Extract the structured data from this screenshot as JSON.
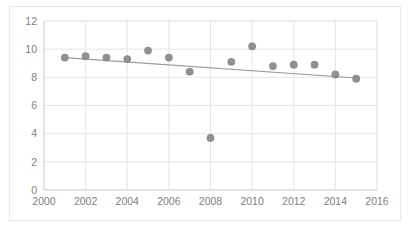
{
  "chart_data": {
    "type": "scatter",
    "title": "",
    "subtitle": "",
    "xlabel": "",
    "ylabel": "",
    "xlim": [
      2000,
      2016
    ],
    "ylim": [
      0,
      12
    ],
    "xticks": [
      2000,
      2002,
      2004,
      2006,
      2008,
      2010,
      2012,
      2014,
      2016
    ],
    "yticks": [
      0,
      2,
      4,
      6,
      8,
      10,
      12
    ],
    "grid": true,
    "legend": "none",
    "x": [
      2001,
      2002,
      2003,
      2004,
      2005,
      2006,
      2007,
      2008,
      2009,
      2010,
      2011,
      2012,
      2013,
      2014,
      2015
    ],
    "series": [
      {
        "name": "data",
        "marker": "circle",
        "color": "#878787",
        "values": [
          9.4,
          9.5,
          9.4,
          9.3,
          9.9,
          9.4,
          8.4,
          3.7,
          9.1,
          10.2,
          8.8,
          8.9,
          8.9,
          8.2,
          7.9
        ]
      }
    ],
    "trendline": {
      "name": "linear-trend",
      "color": "#9a9a9a",
      "x": [
        2001,
        2015
      ],
      "y": [
        9.4,
        7.95
      ]
    },
    "annotations": []
  },
  "axis": {
    "y_tick_labels": [
      "12",
      "10",
      "8",
      "6",
      "4",
      "2",
      "0"
    ],
    "x_tick_labels": [
      "2000",
      "2002",
      "2004",
      "2006",
      "2008",
      "2010",
      "2012",
      "2014",
      "2016"
    ]
  },
  "style": {
    "background": "#ffffff",
    "border_color": "#e8e8e8",
    "gridline_color": "#e6e6e6",
    "axis_color": "#c9c9c9",
    "tick_text_color": "#808080",
    "marker_color": "#878787",
    "trendline_color": "#9a9a9a"
  }
}
